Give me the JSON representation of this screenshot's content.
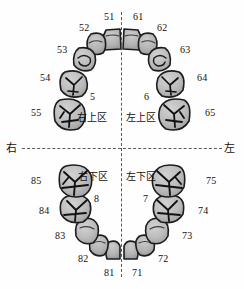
{
  "diagram": {
    "title": "",
    "type": "primary-dentition-tooth-numbering-chart",
    "midline_vertical": "dashed",
    "midline_horizontal": "dashed",
    "colors": {
      "tooth_fill": "#b4b4b4",
      "tooth_fill_light": "#c8c8c8",
      "tooth_outline": "#1c1c1c",
      "fissure": "#111111",
      "dashed_line": "#5a5a5a",
      "text": "#15100d",
      "background": "#fefefe"
    }
  },
  "side_labels": {
    "right": "右",
    "left": "左"
  },
  "quadrants": [
    {
      "id": "upper-right",
      "number": "5",
      "name": "右上区",
      "teeth": [
        "51",
        "52",
        "53",
        "54",
        "55"
      ]
    },
    {
      "id": "upper-left",
      "number": "6",
      "name": "左上区",
      "teeth": [
        "61",
        "62",
        "63",
        "64",
        "65"
      ]
    },
    {
      "id": "lower-left",
      "number": "7",
      "name": "左下区",
      "teeth": [
        "71",
        "72",
        "73",
        "74",
        "75"
      ]
    },
    {
      "id": "lower-right",
      "number": "8",
      "name": "右下区",
      "teeth": [
        "81",
        "82",
        "83",
        "84",
        "85"
      ]
    }
  ],
  "tooth_labels": {
    "t51": "51",
    "t52": "52",
    "t53": "53",
    "t54": "54",
    "t55": "55",
    "t61": "61",
    "t62": "62",
    "t63": "63",
    "t64": "64",
    "t65": "65",
    "t71": "71",
    "t72": "72",
    "t73": "73",
    "t74": "74",
    "t75": "75",
    "t81": "81",
    "t82": "82",
    "t83": "83",
    "t84": "84",
    "t85": "85"
  }
}
